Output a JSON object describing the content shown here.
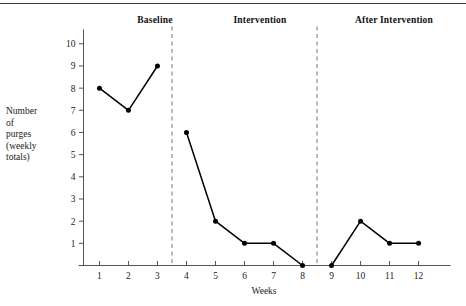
{
  "figure": {
    "top_rule": "horizontal-rule",
    "y_axis_title_lines": [
      "Number",
      "of",
      "purges",
      "(weekly",
      "totals)"
    ],
    "x_axis_title": "Weeks"
  },
  "phases": [
    {
      "label": "Baseline"
    },
    {
      "label": "Intervention"
    },
    {
      "label": "After Intervention"
    }
  ],
  "axes": {
    "y_ticks": [
      "1",
      "2",
      "3",
      "4",
      "5",
      "6",
      "7",
      "8",
      "9",
      "10"
    ],
    "x_ticks": [
      "1",
      "2",
      "3",
      "4",
      "5",
      "6",
      "7",
      "8",
      "9",
      "10",
      "11",
      "12"
    ]
  },
  "colors": {
    "line": "#000000",
    "marker": "#000000",
    "axis": "#555555",
    "divider": "#777777",
    "text": "#1a1a1a",
    "rule": "#3a3a3a"
  },
  "chart_data": {
    "type": "line",
    "title": "",
    "subtitle": "",
    "xlabel": "Weeks",
    "ylabel": "Number of purges (weekly totals)",
    "x": [
      1,
      2,
      3,
      4,
      5,
      6,
      7,
      8,
      9,
      10,
      11,
      12
    ],
    "xlim": [
      0.45,
      13.1
    ],
    "ylim": [
      0,
      10.6
    ],
    "y_ticks": [
      1,
      2,
      3,
      4,
      5,
      6,
      7,
      8,
      9,
      10
    ],
    "x_ticks": [
      1,
      2,
      3,
      4,
      5,
      6,
      7,
      8,
      9,
      10,
      11,
      12
    ],
    "grid": false,
    "legend": "none",
    "markers": "filled-circle",
    "series": [
      {
        "name": "Baseline",
        "x": [
          1,
          2,
          3
        ],
        "values": [
          8,
          7,
          9
        ]
      },
      {
        "name": "Intervention",
        "x": [
          4,
          5,
          6,
          7,
          8
        ],
        "values": [
          6,
          2,
          1,
          1,
          0
        ]
      },
      {
        "name": "After Intervention",
        "x": [
          9,
          10,
          11,
          12
        ],
        "values": [
          0,
          2,
          1,
          1
        ]
      }
    ],
    "annotations": [
      {
        "type": "phase-divider",
        "style": "dashed",
        "x": 3.5,
        "label": "baseline/intervention boundary"
      },
      {
        "type": "phase-divider",
        "style": "dashed",
        "x": 8.5,
        "label": "intervention/after boundary"
      },
      {
        "type": "phase-label",
        "text": "Baseline",
        "x_center": 2.0
      },
      {
        "type": "phase-label",
        "text": "Intervention",
        "x_center": 6.0
      },
      {
        "type": "phase-label",
        "text": "After Intervention",
        "x_center": 10.5
      }
    ]
  }
}
